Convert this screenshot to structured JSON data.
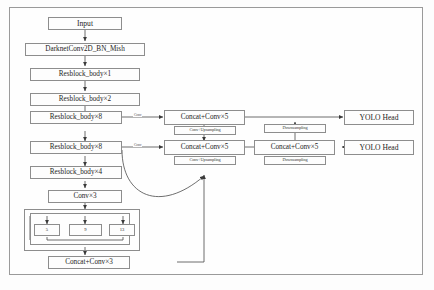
{
  "diagram": {
    "frame_color": "#9a9a9a",
    "box_border_color": "#8d8d8d",
    "box_fill_color": "#fdfdfd",
    "line_color": "#4a4a4a",
    "background_color": "#fdfdfd"
  },
  "backbone": {
    "input": "Input",
    "stem": "DarknetConv2D_BN_Mish",
    "resblock_1": "Resblock_body×1",
    "resblock_2": "Resblock_body×2",
    "resblock_8a": "Resblock_body×8",
    "resblock_8b": "Resblock_body×8",
    "resblock_4": "Resblock_body×4",
    "conv3": "Conv×3"
  },
  "spp": {
    "pool_1": "5",
    "pool_2": "9",
    "pool_3": "13",
    "concat_conv3": "Concat+Conv×3"
  },
  "neck": {
    "concat_conv5_top": "Concat+Conv×5",
    "concat_conv5_mid": "Concat+Conv×5",
    "concat_conv5_right": "Concat+Conv×5",
    "upsample_top": "Conv+Upsampling",
    "upsample_mid": "Conv+Upsampling",
    "downsample_top": "Downsampling",
    "downsample_bottom": "Downsampling"
  },
  "heads": {
    "yolo_head_top": "YOLO Head",
    "yolo_head_bottom": "YOLO Head"
  },
  "edge_labels": {
    "conv_top": "Conv",
    "conv_mid": "Conv"
  }
}
